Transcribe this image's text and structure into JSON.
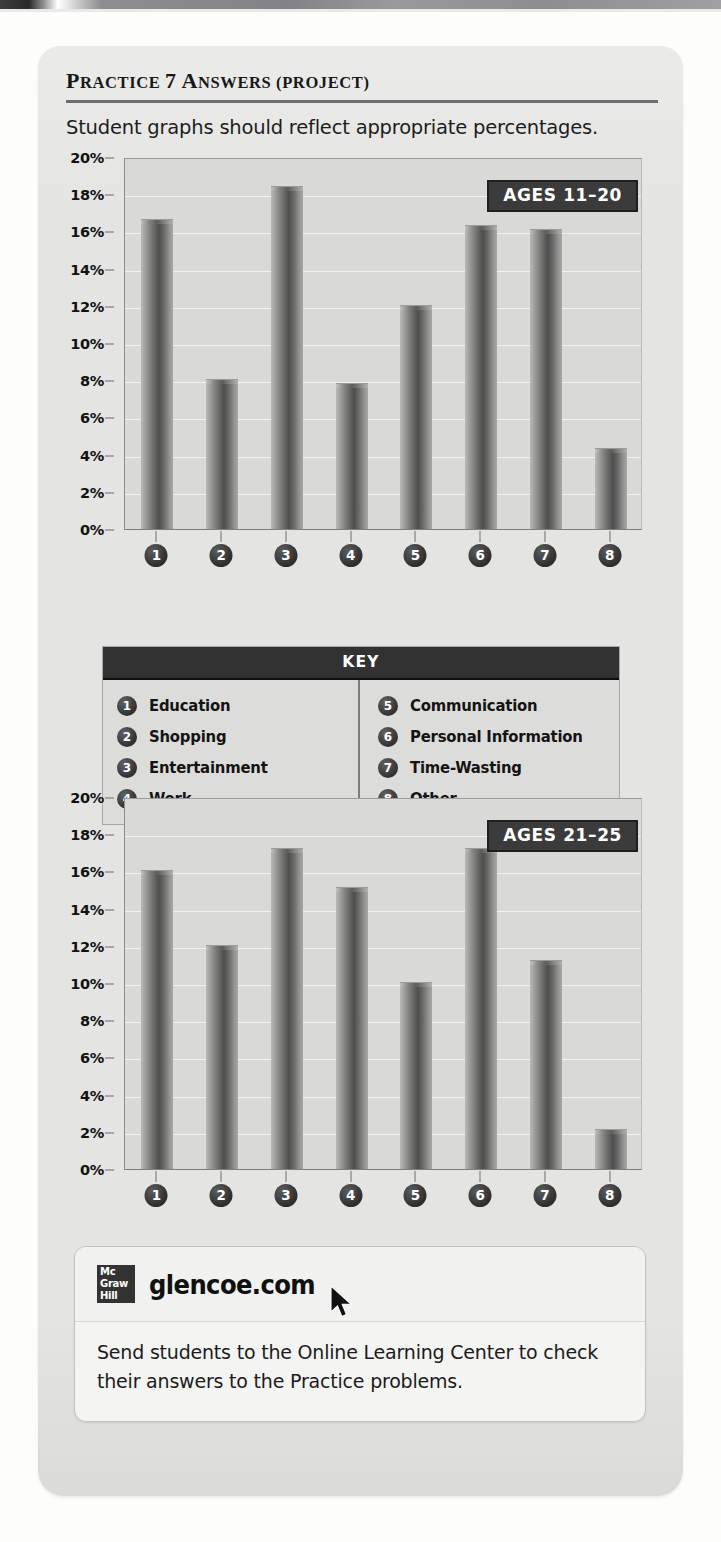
{
  "heading": {
    "text": "PRACTICE 7 ANSWERS (PROJECT)",
    "parts": {
      "p1": "P",
      "p2": "RACTICE ",
      "p3": "7 A",
      "p4": "NSWERS (P",
      "p5": "ROJECT)"
    }
  },
  "subtitle": "Student graphs should reflect appropriate percentages.",
  "key": {
    "header": "KEY",
    "left": [
      {
        "num": "1",
        "label": "Education"
      },
      {
        "num": "2",
        "label": "Shopping"
      },
      {
        "num": "3",
        "label": "Entertainment"
      },
      {
        "num": "4",
        "label": "Work"
      }
    ],
    "right": [
      {
        "num": "5",
        "label": "Communication"
      },
      {
        "num": "6",
        "label": "Personal Information"
      },
      {
        "num": "7",
        "label": "Time-Wasting"
      },
      {
        "num": "8",
        "label": "Other"
      }
    ]
  },
  "footer": {
    "logo_line1": "Mc",
    "logo_line2": "Graw",
    "logo_line3": "Hill",
    "brand": "glencoe.com",
    "body": "Send students to the Online Learning Center to check their answers to the Practice problems."
  },
  "colors": {
    "card_bg": "#e4e4e2",
    "plot_bg": "#d9d9d7",
    "badge_bg": "#3b3b3b",
    "key_header_bg": "#323232",
    "bar_dark": "#4e4e4e",
    "text": "#141414"
  },
  "chart_data": [
    {
      "type": "bar",
      "title": "AGES 11-20",
      "badge": "AGES 11–20",
      "xlabel": "",
      "ylabel": "",
      "ylim": [
        0,
        20
      ],
      "grid": true,
      "legend_position": "below-chart",
      "categories": [
        "1",
        "2",
        "3",
        "4",
        "5",
        "6",
        "7",
        "8"
      ],
      "category_labels": [
        "Education",
        "Shopping",
        "Entertainment",
        "Work",
        "Communication",
        "Personal Information",
        "Time-Wasting",
        "Other"
      ],
      "ticks": [
        "0%",
        "2%",
        "4%",
        "6%",
        "8%",
        "10%",
        "12%",
        "14%",
        "16%",
        "18%",
        "20%"
      ],
      "tick_values": [
        0,
        2,
        4,
        6,
        8,
        10,
        12,
        14,
        16,
        18,
        20
      ],
      "values": [
        16.6,
        8.0,
        18.4,
        7.8,
        12.0,
        16.3,
        16.1,
        4.3
      ],
      "value_unit": "%"
    },
    {
      "type": "bar",
      "title": "AGES 21-25",
      "badge": "AGES 21–25",
      "xlabel": "",
      "ylabel": "",
      "ylim": [
        0,
        20
      ],
      "grid": true,
      "legend_position": "above-chart",
      "categories": [
        "1",
        "2",
        "3",
        "4",
        "5",
        "6",
        "7",
        "8"
      ],
      "category_labels": [
        "Education",
        "Shopping",
        "Entertainment",
        "Work",
        "Communication",
        "Personal Information",
        "Time-Wasting",
        "Other"
      ],
      "ticks": [
        "0%",
        "2%",
        "4%",
        "6%",
        "8%",
        "10%",
        "12%",
        "14%",
        "16%",
        "18%",
        "20%"
      ],
      "tick_values": [
        0,
        2,
        4,
        6,
        8,
        10,
        12,
        14,
        16,
        18,
        20
      ],
      "values": [
        16.0,
        12.0,
        17.2,
        15.1,
        10.0,
        17.2,
        11.2,
        2.1
      ],
      "value_unit": "%"
    }
  ]
}
